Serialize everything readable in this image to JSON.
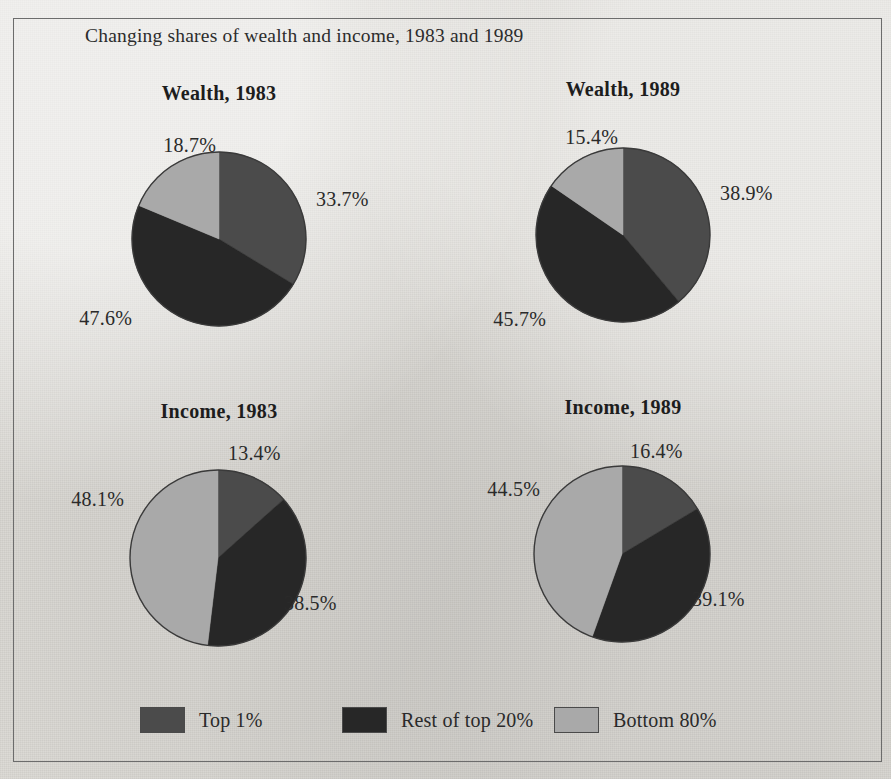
{
  "figure": {
    "title": "Changing shares of wealth and income, 1983 and 1989",
    "background_color": "#dedcd7",
    "frame_color": "#6c6c6c",
    "text_color": "#2a2a2a"
  },
  "series_colors": {
    "top_1": "#4b4b4b",
    "rest_top_20": "#272727",
    "bottom_80": "#a9a9a9"
  },
  "legend": {
    "entries": [
      {
        "label": "Top 1%",
        "color": "#4b4b4b",
        "swatch_name": "legend-swatch-top-1"
      },
      {
        "label": "Rest of top 20%",
        "color": "#272727",
        "swatch_name": "legend-swatch-rest-of-top-20"
      },
      {
        "label": "Bottom 80%",
        "color": "#a9a9a9",
        "swatch_name": "legend-swatch-bottom-80"
      }
    ]
  },
  "panels": [
    {
      "id": "wealth-1983",
      "title": "Wealth, 1983",
      "labels": {
        "top_1": "33.7%",
        "rest_top_20": "47.6%",
        "bottom_80": "18.7%"
      }
    },
    {
      "id": "wealth-1989",
      "title": "Wealth, 1989",
      "labels": {
        "top_1": "38.9%",
        "rest_top_20": "45.7%",
        "bottom_80": "15.4%"
      }
    },
    {
      "id": "income-1983",
      "title": "Income, 1983",
      "labels": {
        "top_1": "13.4%",
        "rest_top_20": "38.5%",
        "bottom_80": "48.1%"
      }
    },
    {
      "id": "income-1989",
      "title": "Income, 1989",
      "labels": {
        "top_1": "16.4%",
        "rest_top_20": "39.1%",
        "bottom_80": "44.5%"
      }
    }
  ],
  "chart_data": {
    "type": "pie",
    "title": "Changing shares of wealth and income, 1983 and 1989",
    "categories": [
      "Top 1%",
      "Rest of top 20%",
      "Bottom 80%"
    ],
    "legend_position": "bottom",
    "grid": false,
    "units": "percent",
    "start_angle_deg": 0,
    "direction": "clockwise",
    "charts": [
      {
        "title": "Wealth, 1983",
        "measure": "Wealth",
        "year": 1983,
        "values": [
          33.7,
          47.6,
          18.7
        ],
        "labels": [
          "33.7%",
          "47.6%",
          "18.7%"
        ],
        "colors": [
          "#4b4b4b",
          "#272727",
          "#a9a9a9"
        ]
      },
      {
        "title": "Wealth, 1989",
        "measure": "Wealth",
        "year": 1989,
        "values": [
          38.9,
          45.7,
          15.4
        ],
        "labels": [
          "38.9%",
          "45.7%",
          "15.4%"
        ],
        "colors": [
          "#4b4b4b",
          "#272727",
          "#a9a9a9"
        ]
      },
      {
        "title": "Income, 1983",
        "measure": "Income",
        "year": 1983,
        "values": [
          13.4,
          38.5,
          48.1
        ],
        "labels": [
          "13.4%",
          "38.5%",
          "48.1%"
        ],
        "colors": [
          "#4b4b4b",
          "#272727",
          "#a9a9a9"
        ]
      },
      {
        "title": "Income, 1989",
        "measure": "Income",
        "year": 1989,
        "values": [
          16.4,
          39.1,
          44.5
        ],
        "labels": [
          "16.4%",
          "39.1%",
          "44.5%"
        ],
        "colors": [
          "#4b4b4b",
          "#272727",
          "#a9a9a9"
        ]
      }
    ]
  }
}
